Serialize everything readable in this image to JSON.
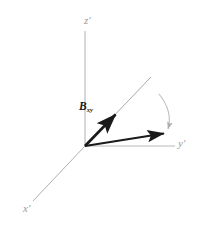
{
  "figure": {
    "background": "#ffffff",
    "width": 202,
    "height": 234
  },
  "colors": {
    "axis": "#b0b0b0",
    "axis_label": "#9a9a9a",
    "vector": "#1a1a1a",
    "reference_line": "#a8a8a8",
    "arc": "#bdbdbd",
    "background": "#ffffff"
  },
  "axes": [
    {
      "name": "z-prime-axis",
      "label": "z",
      "prime": "′",
      "label_x": 86,
      "label_y": 16,
      "x1": 85,
      "y1": 31,
      "x2": 85,
      "y2": 146
    },
    {
      "name": "y-prime-axis",
      "label": "y",
      "prime": "′",
      "label_x": 179,
      "label_y": 139,
      "x1": 85,
      "y1": 146,
      "x2": 175,
      "y2": 146
    },
    {
      "name": "x-prime-axis",
      "label": "x",
      "prime": "′",
      "label_x": 24,
      "label_y": 204,
      "x1": 85,
      "y1": 146,
      "x2": 33,
      "y2": 201
    }
  ],
  "vectors": [
    {
      "name": "b-field-vector",
      "label": "B",
      "subscript": "xy",
      "label_x": 80,
      "label_y": 103,
      "x1": 85,
      "y1": 146,
      "x2": 119,
      "y2": 111,
      "color": "#1a1a1a",
      "width": 2.6
    },
    {
      "name": "magnetization-vector",
      "label": "",
      "subscript": "",
      "x1": 85,
      "y1": 146,
      "x2": 168,
      "y2": 133,
      "color": "#1a1a1a",
      "width": 2.2
    }
  ],
  "reference_line": {
    "name": "projection-reference-line",
    "x1": 85,
    "y1": 146,
    "x2": 151,
    "y2": 77,
    "color": "#a8a8a8",
    "width": 1.0
  },
  "rotation_arc": {
    "name": "rotation-direction-arc",
    "start_x": 159,
    "start_y": 94,
    "ctrl_x": 172,
    "ctrl_y": 110,
    "end_x": 168,
    "end_y": 130,
    "color": "#bdbdbd",
    "width": 1.0,
    "label": "",
    "label_x": 158,
    "label_y": 88
  }
}
